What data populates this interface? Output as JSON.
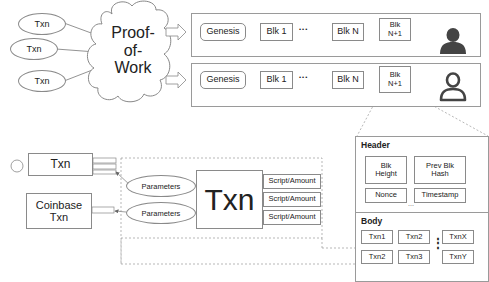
{
  "top": {
    "txn_inputs": [
      "Txn",
      "Txn",
      "Txn"
    ],
    "cloud_label": "Proof-\nof-\nWork",
    "cloud_lines": [
      "Proof-",
      "of-",
      "Work"
    ]
  },
  "chains": [
    {
      "blocks": [
        "Genesis",
        "Blk 1",
        "Blk N",
        "Blk N+1"
      ],
      "block_lines_last": [
        "Blk",
        "N+1"
      ],
      "ellipsis": "•••",
      "user_icon": "user-filled-icon"
    },
    {
      "blocks": [
        "Genesis",
        "Blk 1",
        "Blk N",
        "Blk N+1"
      ],
      "block_lines_last": [
        "Blk",
        "N+1"
      ],
      "ellipsis": "•••",
      "user_icon": "user-outline-icon"
    }
  ],
  "block_detail": {
    "header_title": "Header",
    "header_fields": [
      {
        "lines": [
          "Blk",
          "Height"
        ]
      },
      {
        "lines": [
          "Prev Blk",
          "Hash"
        ]
      },
      {
        "lines": [
          "Nonce"
        ]
      },
      {
        "lines": [
          "Timestamp"
        ]
      }
    ],
    "header_more": "...",
    "body_title": "Body",
    "body_txns": [
      "Txn1",
      "Txn2",
      "TxnX",
      "Txn2",
      "Txn3",
      "TxnY"
    ],
    "body_vdots": "⋮"
  },
  "txn_structure": {
    "input_txn": "Txn",
    "coinbase_txn_lines": [
      "Coinbase",
      "Txn"
    ],
    "parameters": [
      "Parameters",
      "Parameters"
    ],
    "main_label": "Txn",
    "outputs": [
      "Script/Amount",
      "Script/Amount",
      "Script/Amount"
    ]
  }
}
